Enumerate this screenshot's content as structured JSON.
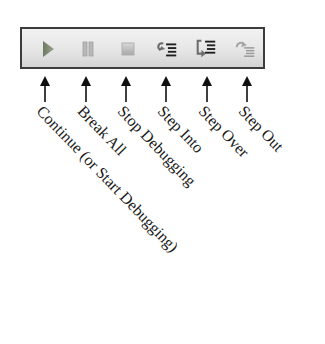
{
  "toolbar": {
    "buttons": [
      {
        "id": "continue",
        "icon": "play-icon",
        "label": "Continue (or Start Debugging)"
      },
      {
        "id": "break-all",
        "icon": "pause-icon",
        "label": "Break All"
      },
      {
        "id": "stop-debugging",
        "icon": "stop-icon",
        "label": "Stop Debugging"
      },
      {
        "id": "step-into",
        "icon": "step-into-icon",
        "label": "Step Into"
      },
      {
        "id": "step-over",
        "icon": "step-over-icon",
        "label": "Step Over"
      },
      {
        "id": "step-out",
        "icon": "step-out-icon",
        "label": "Step Out"
      }
    ]
  },
  "labels": {
    "continue": "Continue (or Start Debugging)",
    "break_all": "Break All",
    "stop_debugging": "Stop Debugging",
    "step_into": "Step Into",
    "step_over": "Step Over",
    "step_out": "Step Out"
  },
  "colors": {
    "frame_border": "#3c3c3c",
    "toolbar_top": "#f2f2f2",
    "toolbar_bottom": "#d4d4d4",
    "icon_disabled": "#9a9a9a",
    "icon_play": "#7d8a6e",
    "icon_active": "#1e1e1e",
    "text": "#1a1a1a"
  }
}
